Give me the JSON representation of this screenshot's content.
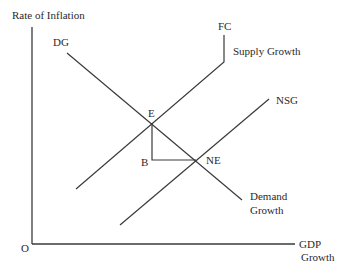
{
  "diagram": {
    "type": "economics-aggregate-demand-supply-growth",
    "axes": {
      "y_label": "Rate of Inflation",
      "x_label_line1": "GDP",
      "x_label_line2": "Growth",
      "origin_label": "O"
    },
    "curves": {
      "demand": {
        "top_label": "DG",
        "end_label_line1": "Demand",
        "end_label_line2": "Growth"
      },
      "supply": {
        "top_label": "FC",
        "side_label": "Supply Growth"
      },
      "new_supply": {
        "label": "NSG"
      }
    },
    "points": {
      "e": "E",
      "b": "B",
      "ne": "NE"
    },
    "colors": {
      "line": "#3a3a3a",
      "text": "#2a2a2a",
      "background": "#ffffff"
    }
  }
}
